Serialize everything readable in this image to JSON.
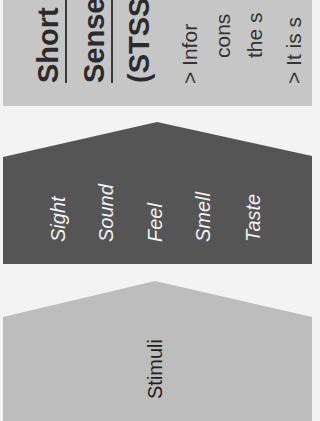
{
  "colors": {
    "background": "#f3f3f3",
    "info_panel": "#c6c6c6",
    "senses_shape": "#555555",
    "stimuli_shape": "#bdbdbd",
    "senses_text": "#f2f2f2",
    "title_text": "#2b2b2b"
  },
  "orientation": "rotated 90deg counter-clockwise",
  "info_panel": {
    "title_lines": [
      "Short",
      "Sense",
      "(STSS"
    ],
    "body_lines": [
      "> Infor",
      "cons",
      "the s",
      "> It is s"
    ]
  },
  "senses": {
    "items": [
      "Sight",
      "Sound",
      "Feel",
      "Smell",
      "Taste"
    ]
  },
  "stimuli": {
    "label": "Stimuli"
  }
}
